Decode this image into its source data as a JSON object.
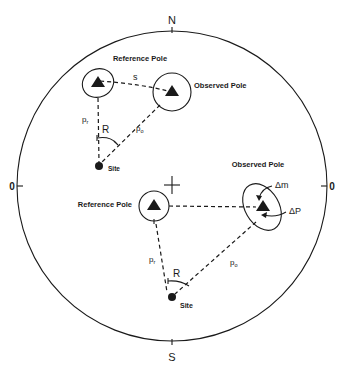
{
  "diagram": {
    "type": "stereonet-pole-comparison",
    "compass": {
      "north": "N",
      "south": "S",
      "west": "0",
      "east": "0"
    },
    "upper_example": {
      "reference_pole_label": "Reference Pole",
      "observed_pole_label": "Observed Pole",
      "site_label": "Site",
      "distance_s_label": "s",
      "pr_label": "p",
      "pr_sub": "r",
      "po_label": "p",
      "po_sub": "o",
      "rotation_label": "R"
    },
    "lower_example": {
      "reference_pole_label": "Reference Pole",
      "observed_pole_label": "Observed Pole",
      "site_label": "Site",
      "pr_label": "p",
      "pr_sub": "r",
      "po_label": "p",
      "po_sub": "o",
      "rotation_label": "R",
      "delta_m_label": "Δm",
      "delta_p_label": "ΔP"
    },
    "colors": {
      "ink": "#1a1a1a",
      "background": "#ffffff"
    }
  }
}
